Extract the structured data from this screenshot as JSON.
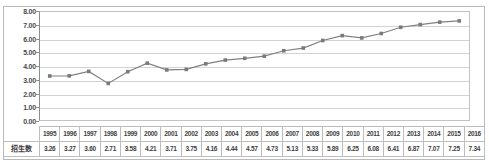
{
  "chart_title": "",
  "row_label": "招生数",
  "axis": {
    "y_ticks": [
      "8.00",
      "7.00",
      "6.00",
      "5.00",
      "4.00",
      "3.00",
      "2.00",
      "1.00",
      "0.00"
    ]
  },
  "colors": {
    "series_line": "#808080",
    "series_marker": "#7a7a7a",
    "gridline": "#d2d2d2",
    "axis": "#8d8d8d",
    "frame": "#b9b9b9",
    "table_border": "#bdbdbd",
    "text": "#3f3f3f"
  },
  "chart_data": {
    "type": "line",
    "title": "",
    "xlabel": "",
    "ylabel": "",
    "ylim": [
      0.0,
      8.0
    ],
    "ytick_step": 1.0,
    "grid": true,
    "legend": "none",
    "categories": [
      "1995",
      "1996",
      "1997",
      "1998",
      "1999",
      "2000",
      "2001",
      "2002",
      "2003",
      "2004",
      "2005",
      "2006",
      "2007",
      "2008",
      "2009",
      "2010",
      "2011",
      "2012",
      "2013",
      "2014",
      "2015",
      "2016"
    ],
    "series": [
      {
        "name": "招生数",
        "values": [
          3.26,
          3.27,
          3.6,
          2.71,
          3.58,
          4.21,
          3.71,
          3.75,
          4.16,
          4.44,
          4.57,
          4.73,
          5.13,
          5.33,
          5.89,
          6.25,
          6.08,
          6.41,
          6.87,
          7.07,
          7.25,
          7.34
        ]
      }
    ]
  }
}
